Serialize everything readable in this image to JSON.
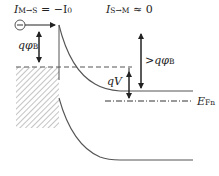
{
  "diagram": {
    "labels": {
      "current_m_to_s": "I",
      "current_m_to_s_sub": "M→S",
      "current_m_to_s_value": " = −I",
      "current_m_to_s_value_sub": "0",
      "current_s_to_m": "I",
      "current_s_to_m_sub": "S→M",
      "current_s_to_m_value": " ≈ 0",
      "barrier": "qφ",
      "barrier_sub": "B",
      "barrier_gt": ">qφ",
      "barrier_gt_sub": "B",
      "bias": "qV",
      "quasi_fermi": "E",
      "quasi_fermi_sub": "Fn"
    },
    "elements": [
      "metal (hatched)",
      "electron (circle with minus)",
      "conduction band",
      "valence band",
      "metal Fermi level (dashed)",
      "quasi Fermi level (dash-dot)"
    ],
    "colors": {
      "line": "#555555",
      "hatch": "#777777",
      "text": "#222222"
    }
  }
}
